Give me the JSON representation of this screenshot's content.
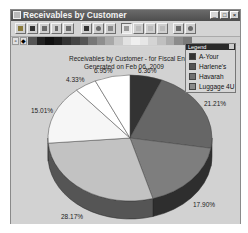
{
  "window": {
    "title": "Receivables by Customer",
    "controls": {
      "minimize": "_",
      "maximize": "□",
      "close": "×"
    }
  },
  "toolbar": {
    "buttons": [
      {
        "name": "open-icon",
        "x": 4
      },
      {
        "name": "save-icon",
        "x": 16
      },
      {
        "name": "email-icon",
        "x": 28
      },
      {
        "name": "cut-icon",
        "x": 40
      },
      {
        "name": "print-icon",
        "x": 52
      },
      {
        "name": "find-icon",
        "x": 70
      },
      {
        "name": "refresh-icon",
        "x": 82
      },
      {
        "name": "chart-wizard-icon",
        "x": 94
      },
      {
        "name": "layout-page-icon",
        "x": 110,
        "pressed": true
      },
      {
        "name": "layout-list-icon",
        "x": 122
      },
      {
        "name": "layout-columns-icon",
        "x": 134
      },
      {
        "name": "layout-rows-icon",
        "x": 146
      },
      {
        "name": "chart-properties-icon",
        "x": 162
      },
      {
        "name": "zoom-icon",
        "x": 174
      }
    ]
  },
  "palette": {
    "buttons": [
      "▫",
      "◆"
    ],
    "swatches": [
      "#555555",
      "#222222",
      "#111111",
      "#1c1c1c",
      "#333333",
      "#444444",
      "#555555",
      "#777777",
      "#8e8e8e",
      "#a8a8a8",
      "#c8c8c8",
      "#e2e2e2",
      "#efefef",
      "#e6e6e6",
      "#d4d4d4",
      "#c0c0c0",
      "#ababab",
      "#8c8c8c",
      "#7a7a7a"
    ]
  },
  "chart_data": {
    "type": "pie",
    "title": "Receivables by Customer -  for Fiscal End",
    "subtitle": "Generated on Feb 06, 2009",
    "style": "3d",
    "slices": [
      {
        "label": "A-Your",
        "value": 6.36,
        "display": "6.36%",
        "color": "#333333",
        "side": "#1e1e1e"
      },
      {
        "label": "Harlene's",
        "value": 21.21,
        "display": "21.21%",
        "color": "#666666",
        "side": "#3e3e3e"
      },
      {
        "label": "Havarah",
        "value": 17.9,
        "display": "17.90%",
        "color": "#7e7e7e",
        "side": "#2e2e2e"
      },
      {
        "label": "Luggage 4U",
        "value": 28.17,
        "display": "28.17%",
        "color": "#c2c2c2",
        "side": "#555555"
      },
      {
        "label": "",
        "value": 15.01,
        "display": "15.01%",
        "color": "#f6f6f6",
        "side": "#9a9a9a"
      },
      {
        "label": "",
        "value": 4.33,
        "display": "4.33%",
        "color": "#ffffff",
        "side": "#aaaaaa"
      },
      {
        "label": "",
        "value": 6.95,
        "display": "6.95%",
        "color": "#ffffff",
        "side": "#aaaaaa"
      }
    ],
    "legend": {
      "title": "Legend",
      "position": "top-right",
      "entries": [
        {
          "label": "A-Your",
          "color": "#333333"
        },
        {
          "label": "Harlene's",
          "color": "#555555"
        },
        {
          "label": "Havarah",
          "color": "#707070"
        },
        {
          "label": "Luggage 4U",
          "color": "#8a8a8a"
        }
      ]
    }
  },
  "labels": {
    "p0": "6.36%",
    "p1": "21.21%",
    "p2": "17.90%",
    "p3": "28.17%",
    "p4": "15.01%",
    "p5": "4.33%",
    "p6": "6.95%"
  }
}
